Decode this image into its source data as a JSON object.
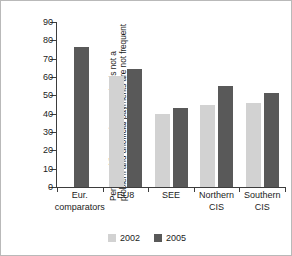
{
  "chart_data": {
    "type": "bar",
    "title": "",
    "subtitle": "",
    "xlabel": "",
    "ylabel_line1": "Percent of firms saying corruption is not a",
    "ylabel_line2": "problem and unofficial payments are not frequent",
    "ylabel": "Percent of firms saying corruption is not a problem and unofficial payments are not frequent",
    "categories": [
      "Eur. comparators",
      "EU8",
      "SEE",
      "Northern CIS",
      "Southern CIS"
    ],
    "category_lines": [
      [
        "Eur.",
        "comparators"
      ],
      [
        "EU8"
      ],
      [
        "SEE"
      ],
      [
        "Northern",
        "CIS"
      ],
      [
        "Southern",
        "CIS"
      ]
    ],
    "series": [
      {
        "name": "2002",
        "color": "#d2d2d2",
        "values": [
          null,
          60.5,
          40.0,
          45.0,
          46.0
        ]
      },
      {
        "name": "2005",
        "color": "#595959",
        "values": [
          76.5,
          64.5,
          43.0,
          55.0,
          51.5
        ]
      }
    ],
    "ylim": [
      0,
      90
    ],
    "yticks": [
      0,
      10,
      20,
      30,
      40,
      50,
      60,
      70,
      80,
      90
    ],
    "ytick_labels": [
      "0",
      "10",
      "20",
      "30",
      "40",
      "50",
      "60",
      "70",
      "80",
      "90"
    ],
    "grid": false,
    "legend_position": "bottom-center",
    "axis_color": "#3d3d3d",
    "background_color": "#ffffff",
    "border_color": "#b9b9b9"
  },
  "legend": {
    "entries": [
      {
        "label": "2002",
        "color": "#d2d2d2"
      },
      {
        "label": "2005",
        "color": "#595959"
      }
    ]
  }
}
